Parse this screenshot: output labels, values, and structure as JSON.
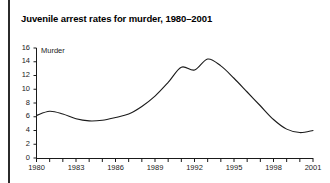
{
  "title": "Juvenile arrest rates for murder, 1980–2001",
  "series_label": "Murder",
  "axis": {
    "y_ticks": [
      "0",
      "2",
      "4",
      "6",
      "8",
      "10",
      "12",
      "14",
      "16"
    ],
    "x_ticks": [
      "1980",
      "1983",
      "1986",
      "1989",
      "1992",
      "1995",
      "1998",
      "2001"
    ]
  },
  "colors": {
    "line": "#1a1a1a",
    "axis": "#1a1a1a",
    "text": "#000000",
    "rule": "#2b2b2b",
    "background": "#ffffff"
  },
  "chart_data": {
    "type": "line",
    "title": "Juvenile arrest rates for murder, 1980–2001",
    "xlabel": "",
    "ylabel": "",
    "xlim": [
      1980,
      2001
    ],
    "ylim": [
      0,
      16
    ],
    "grid": false,
    "legend": "inline-label",
    "series": [
      {
        "name": "Murder",
        "x": [
          1980,
          1981,
          1982,
          1983,
          1984,
          1985,
          1986,
          1987,
          1988,
          1989,
          1990,
          1991,
          1992,
          1993,
          1994,
          1995,
          1996,
          1997,
          1998,
          1999,
          2000,
          2001
        ],
        "values": [
          6.2,
          6.8,
          6.4,
          5.7,
          5.4,
          5.5,
          5.9,
          6.4,
          7.5,
          9.0,
          11.0,
          13.2,
          12.8,
          14.4,
          13.4,
          11.6,
          9.6,
          7.6,
          5.6,
          4.2,
          3.7,
          4.0
        ]
      }
    ]
  }
}
